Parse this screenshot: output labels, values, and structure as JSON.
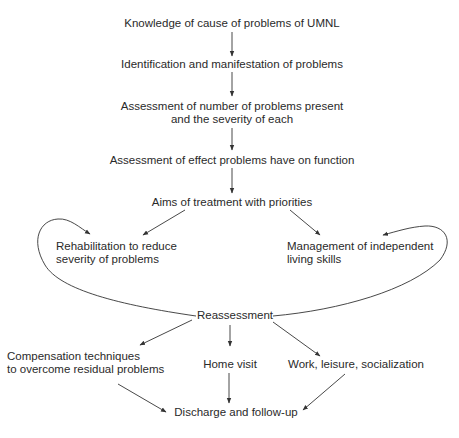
{
  "diagram": {
    "nodes": {
      "knowledge": "Knowledge of cause of problems of UMNL",
      "identification": "Identification and manifestation of problems",
      "assessment_number_l1": "Assessment of number of problems present",
      "assessment_number_l2": "and the severity of each",
      "assessment_effect": "Assessment of effect problems have on function",
      "aims": "Aims of treatment with priorities",
      "rehab_l1": "Rehabilitation to reduce",
      "rehab_l2": "severity of problems",
      "management_l1": "Management of independent",
      "management_l2": "living skills",
      "reassessment": "Reassessment",
      "compensation_l1": "Compensation techniques",
      "compensation_l2": "to overcome residual problems",
      "home_visit": "Home visit",
      "work": "Work, leisure, socialization",
      "discharge": "Discharge and follow-up"
    },
    "edges": [
      {
        "from": "knowledge",
        "to": "identification"
      },
      {
        "from": "identification",
        "to": "assessment_number"
      },
      {
        "from": "assessment_number",
        "to": "assessment_effect"
      },
      {
        "from": "assessment_effect",
        "to": "aims"
      },
      {
        "from": "aims",
        "to": "rehab"
      },
      {
        "from": "aims",
        "to": "management"
      },
      {
        "from": "reassessment",
        "to": "rehab",
        "style": "curved-loop"
      },
      {
        "from": "reassessment",
        "to": "management",
        "style": "curved-loop"
      },
      {
        "from": "reassessment",
        "to": "compensation"
      },
      {
        "from": "reassessment",
        "to": "home_visit"
      },
      {
        "from": "reassessment",
        "to": "work"
      },
      {
        "from": "compensation",
        "to": "discharge"
      },
      {
        "from": "home_visit",
        "to": "discharge"
      },
      {
        "from": "work",
        "to": "discharge"
      }
    ],
    "colors": {
      "text": "#2a2a2a",
      "line": "#333333",
      "background": "#ffffff"
    }
  }
}
